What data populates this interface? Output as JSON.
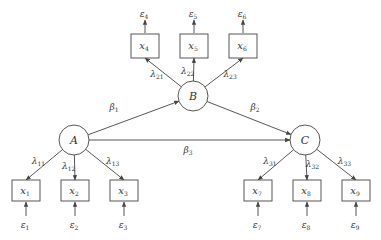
{
  "diagram": {
    "type": "structural-equation-model",
    "colors": {
      "stroke": "#444444",
      "text": "#333333",
      "background": "#ffffff"
    },
    "latent": [
      {
        "id": "A",
        "label": "A",
        "cx": 74,
        "cy": 140,
        "r": 15
      },
      {
        "id": "B",
        "label": "B",
        "cx": 193,
        "cy": 96,
        "r": 15
      },
      {
        "id": "C",
        "label": "C",
        "cx": 305,
        "cy": 140,
        "r": 15
      }
    ],
    "observed": [
      {
        "id": "x1",
        "base": "x",
        "sub": "1",
        "x": 12,
        "y": 180,
        "w": 28,
        "h": 21,
        "error": {
          "base": "ε",
          "sub": "1"
        },
        "error_dir": "below",
        "loading": {
          "base": "λ",
          "sub": "11"
        }
      },
      {
        "id": "x2",
        "base": "x",
        "sub": "2",
        "x": 61,
        "y": 180,
        "w": 28,
        "h": 21,
        "error": {
          "base": "ε",
          "sub": "2"
        },
        "error_dir": "below",
        "loading": {
          "base": "λ",
          "sub": "12"
        }
      },
      {
        "id": "x3",
        "base": "x",
        "sub": "3",
        "x": 110,
        "y": 180,
        "w": 28,
        "h": 21,
        "error": {
          "base": "ε",
          "sub": "3"
        },
        "error_dir": "below",
        "loading": {
          "base": "λ",
          "sub": "13"
        }
      },
      {
        "id": "x4",
        "base": "x",
        "sub": "4",
        "x": 131,
        "y": 34,
        "w": 28,
        "h": 24,
        "error": {
          "base": "ε",
          "sub": "4"
        },
        "error_dir": "above",
        "loading": {
          "base": "λ",
          "sub": "21"
        }
      },
      {
        "id": "x5",
        "base": "x",
        "sub": "5",
        "x": 180,
        "y": 34,
        "w": 28,
        "h": 24,
        "error": {
          "base": "ε",
          "sub": "5"
        },
        "error_dir": "above",
        "loading": {
          "base": "λ",
          "sub": "22"
        }
      },
      {
        "id": "x6",
        "base": "x",
        "sub": "6",
        "x": 229,
        "y": 34,
        "w": 28,
        "h": 24,
        "error": {
          "base": "ε",
          "sub": "6"
        },
        "error_dir": "above",
        "loading": {
          "base": "λ",
          "sub": "23"
        }
      },
      {
        "id": "x7",
        "base": "x",
        "sub": "7",
        "x": 244,
        "y": 180,
        "w": 28,
        "h": 21,
        "error": {
          "base": "ε",
          "sub": "7"
        },
        "error_dir": "below",
        "loading": {
          "base": "λ",
          "sub": "31"
        }
      },
      {
        "id": "x8",
        "base": "x",
        "sub": "8",
        "x": 293,
        "y": 180,
        "w": 28,
        "h": 21,
        "error": {
          "base": "ε",
          "sub": "8"
        },
        "error_dir": "below",
        "loading": {
          "base": "λ",
          "sub": "32"
        }
      },
      {
        "id": "x9",
        "base": "x",
        "sub": "9",
        "x": 342,
        "y": 180,
        "w": 28,
        "h": 21,
        "error": {
          "base": "ε",
          "sub": "9"
        },
        "error_dir": "below",
        "loading": {
          "base": "λ",
          "sub": "33"
        }
      }
    ],
    "measurement": {
      "A": [
        "x1",
        "x2",
        "x3"
      ],
      "B": [
        "x4",
        "x5",
        "x6"
      ],
      "C": [
        "x7",
        "x8",
        "x9"
      ]
    },
    "structural": [
      {
        "from": "A",
        "to": "B",
        "label": {
          "base": "β",
          "sub": "1"
        },
        "lx": 114,
        "ly": 110
      },
      {
        "from": "B",
        "to": "C",
        "label": {
          "base": "β",
          "sub": "2"
        },
        "lx": 255,
        "ly": 110
      },
      {
        "from": "A",
        "to": "C",
        "label": {
          "base": "β",
          "sub": "3"
        },
        "lx": 188,
        "ly": 153
      }
    ]
  }
}
